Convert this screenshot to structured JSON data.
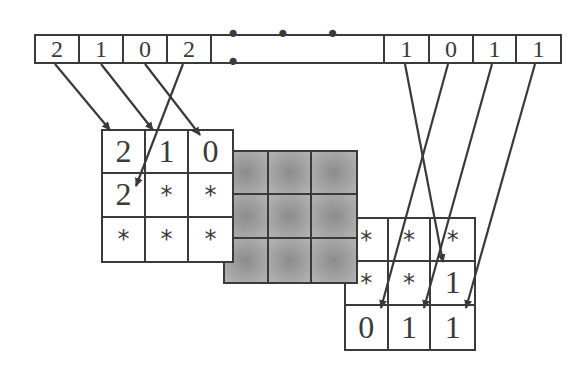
{
  "diagram": {
    "type": "mapping of bit/digit stream into 3x3 grid blocks",
    "colors": {
      "line": "#3a3a3a",
      "gray_block": "#9a9a9a",
      "background": "#ffffff"
    }
  },
  "strip": {
    "cells": [
      {
        "value": "2"
      },
      {
        "value": "1"
      },
      {
        "value": "0"
      },
      {
        "value": "2"
      },
      {
        "value": "• • • •"
      },
      {
        "value": "1"
      },
      {
        "value": "0"
      },
      {
        "value": "1"
      },
      {
        "value": "1"
      }
    ]
  },
  "left_grid": {
    "cells": [
      "2",
      "1",
      "0",
      "2",
      "*",
      "*",
      "*",
      "*",
      "*"
    ]
  },
  "middle_grid": {
    "cells": [
      "",
      "",
      "",
      "",
      "",
      "",
      "",
      "",
      ""
    ],
    "fill": "gray (shaded)"
  },
  "right_grid": {
    "cells": [
      "*",
      "*",
      "*",
      "*",
      "*",
      "1",
      "0",
      "1",
      "1"
    ]
  },
  "arrows": [
    {
      "from": "strip[0] '2'",
      "to": "left_grid[0]"
    },
    {
      "from": "strip[1] '1'",
      "to": "left_grid[1]"
    },
    {
      "from": "strip[2] '0'",
      "to": "left_grid[2]"
    },
    {
      "from": "strip[3] '2'",
      "to": "left_grid[3]"
    },
    {
      "from": "strip[5] '1'",
      "to": "right_grid[5]"
    },
    {
      "from": "strip[6] '0'",
      "to": "right_grid[6]"
    },
    {
      "from": "strip[7] '1'",
      "to": "right_grid[7]"
    },
    {
      "from": "strip[8] '1'",
      "to": "right_grid[8]"
    }
  ]
}
